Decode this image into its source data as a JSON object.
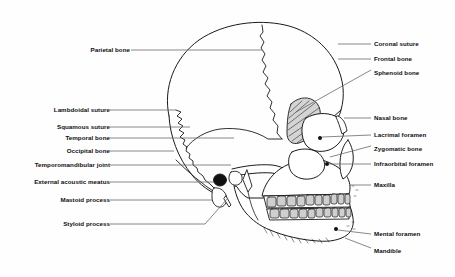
{
  "figure": {
    "background_color": "#fefefe",
    "line_color": "#1a1a1a",
    "leader_color": "#555555",
    "shade_color": "#c9c9c9"
  },
  "labels_left": [
    {
      "text": "Parietal bone",
      "x": 128,
      "y": 50,
      "leader_x2": 262,
      "leader_y2": 50
    },
    {
      "text": "Lambdoidal suture",
      "x": 107,
      "y": 110,
      "leader_x2": 176,
      "leader_y2": 110
    },
    {
      "text": "Squamous suture",
      "x": 107,
      "y": 127,
      "leader_x2": 188,
      "leader_y2": 127
    },
    {
      "text": "Temporal bone",
      "x": 107,
      "y": 138,
      "leader_x2": 232,
      "leader_y2": 138
    },
    {
      "text": "Occipital bone",
      "x": 107,
      "y": 151,
      "leader_x2": 172,
      "leader_y2": 151
    },
    {
      "text": "Temporomandibular joint",
      "x": 107,
      "y": 165,
      "leader_x2": 230,
      "leader_y2": 165
    },
    {
      "text": "External acoustic meatus",
      "x": 107,
      "y": 182,
      "leader_x2": 213,
      "leader_y2": 182
    },
    {
      "text": "Mastoid process",
      "x": 107,
      "y": 200,
      "leader_x2": 212,
      "leader_y2": 200
    },
    {
      "text": "Styloid process",
      "x": 107,
      "y": 224,
      "leader_x2": 205,
      "leader_y2": 224
    }
  ],
  "labels_right": [
    {
      "text": "Coronal suture",
      "x": 374,
      "y": 44,
      "leader_x2": 344,
      "leader_y2": 44
    },
    {
      "text": "Frontal bone",
      "x": 374,
      "y": 59,
      "leader_x2": 344,
      "leader_y2": 59
    },
    {
      "text": "Sphenoid bone",
      "x": 374,
      "y": 73,
      "leader_x2": 344,
      "leader_y2": 73
    },
    {
      "text": "Nasal bone",
      "x": 374,
      "y": 118,
      "leader_x2": 344,
      "leader_y2": 118
    },
    {
      "text": "Lacrimal foramen",
      "x": 374,
      "y": 135,
      "leader_x2": 344,
      "leader_y2": 135
    },
    {
      "text": "Zygomatic bone",
      "x": 374,
      "y": 149,
      "leader_x2": 344,
      "leader_y2": 149
    },
    {
      "text": "Infraorbital foramen",
      "x": 374,
      "y": 164,
      "leader_x2": 344,
      "leader_y2": 164
    },
    {
      "text": "Maxilla",
      "x": 374,
      "y": 185,
      "leader_x2": 344,
      "leader_y2": 185
    },
    {
      "text": "Mental foramen",
      "x": 374,
      "y": 234,
      "leader_x2": 344,
      "leader_y2": 234
    },
    {
      "text": "Mandible",
      "x": 374,
      "y": 251,
      "leader_x2": 344,
      "leader_y2": 251
    }
  ],
  "leaders_angled": [
    {
      "name": "sphenoid-leader",
      "x1": 368,
      "y1": 70,
      "x2": 296,
      "y2": 112
    },
    {
      "name": "zygomatic-leader",
      "x1": 368,
      "y1": 146,
      "x2": 330,
      "y2": 158
    },
    {
      "name": "mandible-leader",
      "x1": 368,
      "y1": 248,
      "x2": 340,
      "y2": 238
    },
    {
      "name": "styloid-leader",
      "x1": 205,
      "y1": 224,
      "x2": 226,
      "y2": 196
    },
    {
      "name": "tmj-pointer",
      "x1": 230,
      "y1": 165,
      "x2": 234,
      "y2": 172
    }
  ]
}
